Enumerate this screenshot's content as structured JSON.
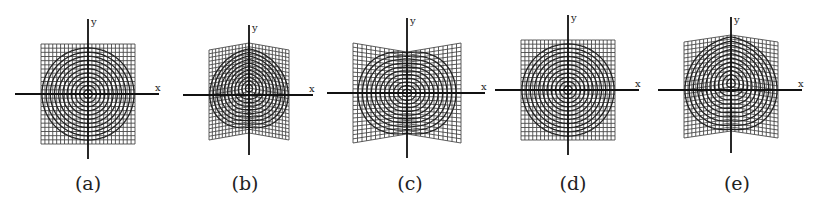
{
  "figure": {
    "panels": [
      {
        "id": "a",
        "label": "(a)",
        "cx": 88,
        "cy": 94,
        "half_w": 47,
        "half_h": 50,
        "warp": "none",
        "label_x": 88,
        "x_label": "x",
        "y_label": "y"
      },
      {
        "id": "b",
        "label": "(b)",
        "cx": 249,
        "cy": 95,
        "half_w": 40,
        "half_h": 45,
        "warp": "shear-up-center",
        "label_x": 245,
        "x_label": "x",
        "y_label": "y"
      },
      {
        "id": "c",
        "label": "(c)",
        "cx": 407,
        "cy": 93,
        "half_w": 54,
        "half_h": 50,
        "warp": "pinch-center",
        "label_x": 410,
        "x_label": "x",
        "y_label": "y"
      },
      {
        "id": "d",
        "label": "(d)",
        "cx": 568,
        "cy": 90,
        "half_w": 47,
        "half_h": 50,
        "warp": "none",
        "label_x": 573,
        "x_label": "x",
        "y_label": "y"
      },
      {
        "id": "e",
        "label": "(e)",
        "cx": 731,
        "cy": 90,
        "half_w": 47,
        "half_h": 48,
        "warp": "shear-up-center",
        "label_x": 737,
        "x_label": "x",
        "y_label": "y"
      }
    ],
    "grid_lines": 24,
    "circles": 11
  }
}
